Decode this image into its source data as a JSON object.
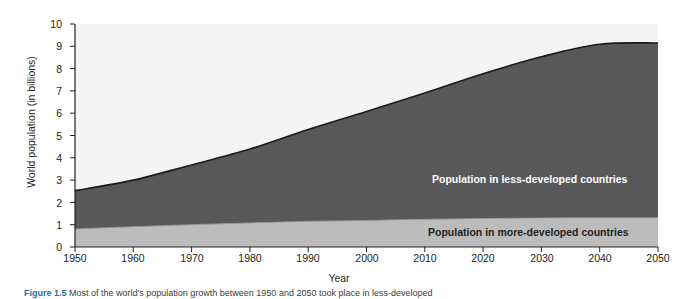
{
  "figure": {
    "caption_label": "Figure 1.5",
    "caption_text": "Most of the world's population growth between 1950 and 2050 took place in less-developed"
  },
  "chart_data": {
    "type": "area",
    "stacked": true,
    "title": "",
    "xlabel": "Year",
    "ylabel": "World population (in billions)",
    "xlim": [
      1950,
      2050
    ],
    "ylim": [
      0,
      10
    ],
    "grid": false,
    "legend_position": "inline-annotations",
    "xticks": [
      "1950",
      "1960",
      "1970",
      "1980",
      "1990",
      "2000",
      "2010",
      "2020",
      "2030",
      "2040",
      "2050"
    ],
    "yticks": [
      "0",
      "1",
      "2",
      "3",
      "4",
      "5",
      "6",
      "7",
      "8",
      "9",
      "10"
    ],
    "x": [
      1950,
      1960,
      1970,
      1980,
      1990,
      2000,
      2010,
      2020,
      2030,
      2040,
      2050
    ],
    "series": [
      {
        "name": "Population in more-developed countries",
        "color": "#bcbcbc",
        "values": [
          0.81,
          0.91,
          1.0,
          1.08,
          1.15,
          1.19,
          1.24,
          1.28,
          1.3,
          1.31,
          1.31
        ]
      },
      {
        "name": "Population in less-developed countries",
        "color": "#58585a",
        "values": [
          1.72,
          2.09,
          2.68,
          3.31,
          4.12,
          4.89,
          5.67,
          6.49,
          7.23,
          7.78,
          7.84
        ]
      }
    ],
    "totals": [
      2.53,
      3.0,
      3.68,
      4.39,
      5.27,
      6.08,
      6.91,
      7.77,
      8.53,
      9.09,
      9.15
    ],
    "annotations": [
      {
        "text": "Population in less-developed countries",
        "color": "#ffffff"
      },
      {
        "text": "Population in more-developed countries",
        "color": "#231f20"
      }
    ]
  }
}
